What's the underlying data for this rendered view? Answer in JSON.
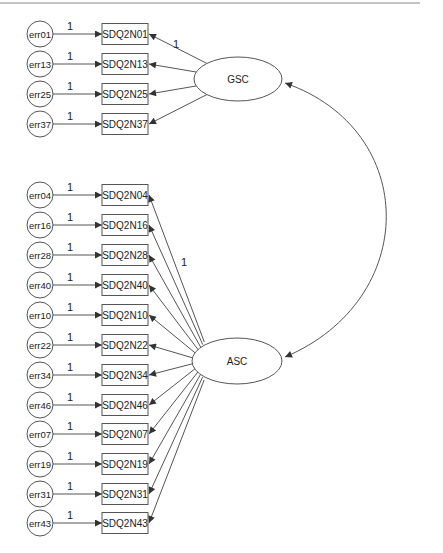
{
  "diagram": {
    "type": "SEM path diagram",
    "top_rule": true,
    "latents": [
      {
        "id": "GSC",
        "label": "GSC",
        "cx": 238,
        "cy": 79,
        "rx": 44,
        "ry": 22
      },
      {
        "id": "ASC",
        "label": "ASC",
        "cx": 237,
        "cy": 361,
        "rx": 45,
        "ry": 23
      }
    ],
    "covariance": {
      "from": "GSC",
      "to": "ASC",
      "label": ""
    },
    "groups": [
      {
        "factor": "GSC",
        "first_loading_label": "1",
        "items": [
          {
            "error": "err01",
            "indicator": "SDQ2N01",
            "error_weight": "1",
            "y": 34
          },
          {
            "error": "err13",
            "indicator": "SDQ2N13",
            "error_weight": "1",
            "y": 64
          },
          {
            "error": "err25",
            "indicator": "SDQ2N25",
            "error_weight": "1",
            "y": 94
          },
          {
            "error": "err37",
            "indicator": "SDQ2N37",
            "error_weight": "1",
            "y": 124
          }
        ]
      },
      {
        "factor": "ASC",
        "first_loading_label": "1",
        "items": [
          {
            "error": "err04",
            "indicator": "SDQ2N04",
            "error_weight": "1",
            "y": 195
          },
          {
            "error": "err16",
            "indicator": "SDQ2N16",
            "error_weight": "1",
            "y": 225
          },
          {
            "error": "err28",
            "indicator": "SDQ2N28",
            "error_weight": "1",
            "y": 255
          },
          {
            "error": "err40",
            "indicator": "SDQ2N40",
            "error_weight": "1",
            "y": 285
          },
          {
            "error": "err10",
            "indicator": "SDQ2N10",
            "error_weight": "1",
            "y": 315
          },
          {
            "error": "err22",
            "indicator": "SDQ2N22",
            "error_weight": "1",
            "y": 345
          },
          {
            "error": "err34",
            "indicator": "SDQ2N34",
            "error_weight": "1",
            "y": 375
          },
          {
            "error": "err46",
            "indicator": "SDQ2N46",
            "error_weight": "1",
            "y": 405
          },
          {
            "error": "err07",
            "indicator": "SDQ2N07",
            "error_weight": "1",
            "y": 434
          },
          {
            "error": "err19",
            "indicator": "SDQ2N19",
            "error_weight": "1",
            "y": 464
          },
          {
            "error": "err31",
            "indicator": "SDQ2N31",
            "error_weight": "1",
            "y": 494
          },
          {
            "error": "err43",
            "indicator": "SDQ2N43",
            "error_weight": "1",
            "y": 523
          }
        ]
      }
    ],
    "colors": {
      "stroke": "#555555",
      "text": "#222222",
      "background": "#ffffff"
    }
  }
}
